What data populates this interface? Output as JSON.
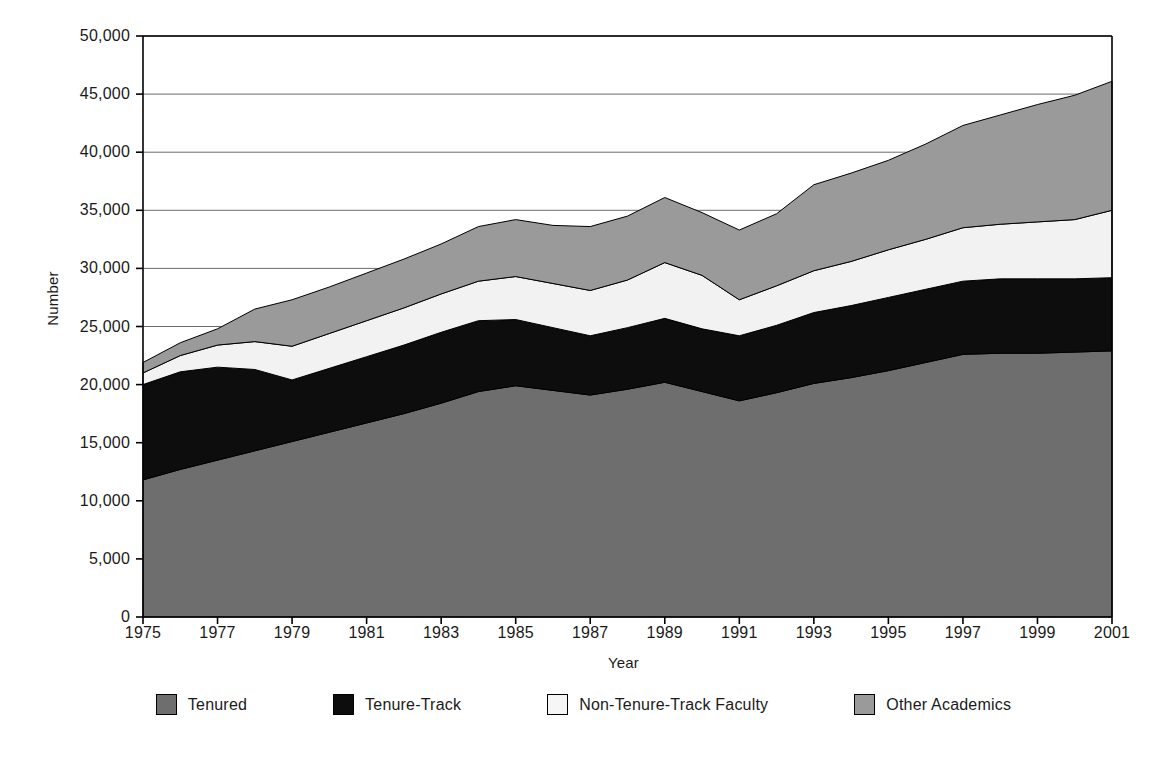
{
  "chart_data": {
    "type": "area",
    "stacked": true,
    "title": "",
    "xlabel": "Year",
    "ylabel": "Number",
    "xlim": [
      1975,
      2001
    ],
    "ylim": [
      0,
      50000
    ],
    "grid": "horizontal",
    "legend_position": "bottom",
    "x": [
      1975,
      1976,
      1977,
      1978,
      1979,
      1980,
      1981,
      1982,
      1983,
      1984,
      1985,
      1986,
      1987,
      1988,
      1989,
      1990,
      1991,
      1992,
      1993,
      1994,
      1995,
      1996,
      1997,
      1998,
      1999,
      2000,
      2001
    ],
    "xticks": [
      "1975",
      "1977",
      "1979",
      "1981",
      "1983",
      "1985",
      "1987",
      "1989",
      "1991",
      "1993",
      "1995",
      "1997",
      "1999",
      "2001"
    ],
    "yticks": [
      "0",
      "5,000",
      "10,000",
      "15,000",
      "20,000",
      "25,000",
      "30,000",
      "35,000",
      "40,000",
      "45,000",
      "50,000"
    ],
    "ytick_values": [
      0,
      5000,
      10000,
      15000,
      20000,
      25000,
      30000,
      35000,
      40000,
      45000,
      50000
    ],
    "series": [
      {
        "name": "Tenured",
        "color": "#6e6e6e",
        "values": [
          11800,
          12700,
          13500,
          14300,
          15100,
          15900,
          16700,
          17500,
          18400,
          19400,
          19900,
          19500,
          19100,
          19600,
          20200,
          19400,
          18600,
          19300,
          20100,
          20600,
          21200,
          21900,
          22600,
          22700,
          22700,
          22800,
          22900
        ]
      },
      {
        "name": "Tenure-Track",
        "color": "#0d0d0d",
        "values": [
          8200,
          8400,
          8000,
          7000,
          5300,
          5500,
          5700,
          5900,
          6100,
          6100,
          5700,
          5400,
          5100,
          5300,
          5500,
          5400,
          5600,
          5800,
          6100,
          6200,
          6300,
          6300,
          6300,
          6400,
          6400,
          6300,
          6300
        ]
      },
      {
        "name": "Non-Tenure-Track Faculty",
        "color": "#f2f2f2",
        "values": [
          1000,
          1400,
          1900,
          2400,
          2900,
          3000,
          3100,
          3200,
          3300,
          3400,
          3700,
          3800,
          3900,
          4100,
          4800,
          4600,
          3100,
          3400,
          3600,
          3800,
          4100,
          4300,
          4600,
          4700,
          4900,
          5100,
          5800
        ]
      },
      {
        "name": "Other Academics",
        "color": "#9a9a9a",
        "values": [
          900,
          1100,
          1400,
          2800,
          4000,
          4000,
          4100,
          4200,
          4300,
          4700,
          4900,
          5000,
          5500,
          5500,
          5600,
          5400,
          6000,
          6200,
          7400,
          7600,
          7700,
          8200,
          8800,
          9400,
          10100,
          10700,
          11100
        ]
      }
    ]
  },
  "axes": {
    "ylabel": "Number",
    "xlabel": "Year"
  },
  "legend": {
    "items": [
      {
        "label": "Tenured",
        "color": "#6e6e6e"
      },
      {
        "label": "Tenure-Track",
        "color": "#0d0d0d"
      },
      {
        "label": "Non-Tenure-Track Faculty",
        "color": "#f6f6f6"
      },
      {
        "label": "Other Academics",
        "color": "#9a9a9a"
      }
    ]
  }
}
